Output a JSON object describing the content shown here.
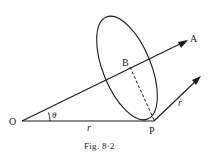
{
  "figure": {
    "caption": "Fig. 8·2",
    "labels": {
      "origin": "O",
      "point_a": "A",
      "point_b": "B",
      "point_p": "P",
      "angle": "θ",
      "radius": "r",
      "velocity": "ṙ"
    },
    "colors": {
      "ink": "#1a1a1a",
      "background": "#ffffff"
    }
  }
}
